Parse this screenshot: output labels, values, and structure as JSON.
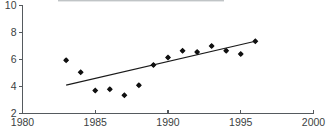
{
  "chart_data": {
    "type": "scatter",
    "title": "",
    "subtitle": "",
    "xlabel": "",
    "ylabel": "",
    "xlim": [
      1980,
      2000
    ],
    "ylim": [
      2,
      10
    ],
    "xticks": [
      1980,
      1985,
      1990,
      1995,
      2000
    ],
    "yticks": [
      2,
      4,
      6,
      8,
      10
    ],
    "xtick_labels": [
      "1980",
      "1985",
      "1990",
      "1995",
      "2000"
    ],
    "ytick_labels": [
      "2",
      "4",
      "6",
      "8",
      "10"
    ],
    "grid": false,
    "legend": null,
    "legend_position": "none",
    "marker": "diamond",
    "marker_color": "#111111",
    "series": [
      {
        "name": "observations",
        "x": [
          1983,
          1984,
          1985,
          1986,
          1987,
          1988,
          1989,
          1990,
          1991,
          1992,
          1993,
          1994,
          1995,
          1996
        ],
        "values": [
          5.95,
          5.05,
          3.7,
          3.8,
          3.35,
          4.1,
          5.6,
          6.15,
          6.65,
          6.55,
          7.0,
          6.65,
          6.4,
          7.35
        ]
      },
      {
        "name": "trend-line",
        "type": "line",
        "x": [
          1983,
          1996
        ],
        "values": [
          4.1,
          7.35
        ],
        "color": "#1a1a1a"
      }
    ],
    "annotations": []
  },
  "axes": {
    "y_axis_name": "y-axis",
    "x_axis_name": "x-axis"
  }
}
